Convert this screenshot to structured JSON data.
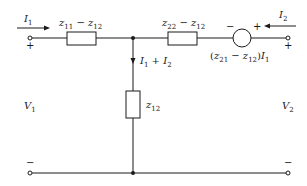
{
  "diagram": {
    "type": "two-port equivalent T-network circuit",
    "labels": {
      "I1": {
        "sym": "I",
        "sub": "1"
      },
      "I2": {
        "sym": "I",
        "sub": "2"
      },
      "V1": {
        "sym": "V",
        "sub": "1"
      },
      "V2": {
        "sym": "V",
        "sub": "2"
      },
      "branch_current": {
        "a": "I",
        "a_sub": "1",
        "op": " + ",
        "b": "I",
        "b_sub": "2"
      },
      "z_left": {
        "a": "z",
        "a_sub": "11",
        "op": " − ",
        "b": "z",
        "b_sub": "12"
      },
      "z_right": {
        "a": "z",
        "a_sub": "22",
        "op": " − ",
        "b": "z",
        "b_sub": "12"
      },
      "z_shunt": {
        "a": "z",
        "a_sub": "12"
      },
      "source": {
        "open": "(",
        "a": "z",
        "a_sub": "21",
        "op": " − ",
        "b": "z",
        "b_sub": "12",
        "close": ")",
        "c": "I",
        "c_sub": "1"
      }
    },
    "signs": {
      "port1_plus": "+",
      "port1_minus": "−",
      "port2_plus": "+",
      "port2_minus": "−",
      "source_minus": "−",
      "source_plus": "+"
    },
    "colors": {
      "line": "#1a1a1a",
      "background": "#ffffff"
    }
  }
}
